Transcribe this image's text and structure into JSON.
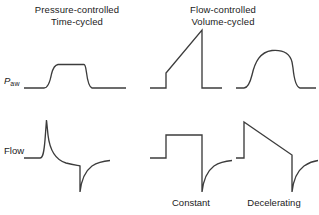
{
  "figure": {
    "background_color": "#ffffff",
    "stroke_color": "#3c3c3c",
    "text_color": "#1a1a1a",
    "width": 319,
    "height": 215
  },
  "columns": [
    {
      "id": "pressure-controlled",
      "title_line1": "Pressure-controlled",
      "title_line2": "Time-cycled"
    },
    {
      "id": "flow-controlled",
      "title_line1": "Flow-controlled",
      "title_line2": "Volume-cycled"
    }
  ],
  "row_labels": {
    "pressure_main": "P",
    "pressure_subscript": "aw",
    "flow": "Flow"
  },
  "sub_captions": [
    {
      "id": "constant",
      "label": "Constant"
    },
    {
      "id": "decelerating",
      "label": "Decelerating"
    }
  ],
  "chart_data": {
    "type": "line",
    "xlabel": "",
    "ylabel": "",
    "grid": false,
    "legend": "none",
    "axis_ticks": "none",
    "panels": [
      {
        "id": "paw-pressure-controlled",
        "row": "Paw",
        "column": "Pressure-controlled Time-cycled",
        "description": "Baseline, rapid rounded rise to a square plateau, sustained plateau, rapid fall back to baseline",
        "baseline_y": 88,
        "peak_y": 64,
        "path": "M 24 88 L 44 88 C 48 88 50 82 51.5 74 C 53 68 54.5 65 58 64.5 L 84 64.5 L 84 64.5 C 85 64.5 85.6 66 86.4 72 C 87.4 80 88.6 87 92 88 L 126 88"
      },
      {
        "id": "paw-constant-flow",
        "row": "Paw",
        "column": "Flow-controlled Volume-cycled / Constant",
        "description": "Baseline, instantaneous step up (resistive), linear ramp rise to peak, instantaneous fall to baseline",
        "baseline_y": 88,
        "step_y": 73,
        "peak_y": 30,
        "path": "M 150 88 L 166 88 L 166 73 L 202 30 L 202 88 L 222 88"
      },
      {
        "id": "paw-decelerating-flow",
        "row": "Paw",
        "column": "Flow-controlled Volume-cycled / Decelerating",
        "description": "Baseline, rounded rise to a domed peak, slight decline, then rapid fall to baseline",
        "baseline_y": 88,
        "peak_y": 50,
        "path": "M 236 88 L 244 88 C 248 88 250 83 252 75 C 255 62 260 52 272 50.5 C 284 49.5 290 54 292 62 L 293 68 C 294 78 296 87 300 88 L 316 88"
      },
      {
        "id": "flow-pressure-controlled",
        "row": "Flow",
        "column": "Pressure-controlled Time-cycled",
        "description": "Baseline, sharp inspiratory spike, exponential decay toward baseline, then abrupt negative expiratory deflection with exponential return to baseline",
        "baseline_y": 158,
        "peak_y": 120,
        "trough_y": 192,
        "path": "M 24 158 L 40 158 C 43 158 44 152 45 140 L 46.5 120 L 48 135 C 50 152 56 160 66 163 C 74 165 78 165.5 80 166 L 80 192 C 81 183 84 172 92 166 C 98 162 104 161 110 160.5"
      },
      {
        "id": "flow-constant",
        "row": "Flow",
        "column": "Flow-controlled Volume-cycled / Constant",
        "description": "Baseline, square step up to constant inspiratory flow, constant plateau, abrupt drop to negative expiratory peak with exponential return",
        "baseline_y": 158,
        "plateau_y": 135,
        "trough_y": 192,
        "path": "M 150 158 L 166 158 L 166 135 L 202 135 L 202 192 C 203 183 206 172 214 166 C 220 162 226 161 232 160.5"
      },
      {
        "id": "flow-decelerating",
        "row": "Flow",
        "column": "Flow-controlled Volume-cycled / Decelerating",
        "description": "Baseline, step up to peak inspiratory flow, linear decelerating ramp down, abrupt drop to negative expiratory peak with exponential return",
        "baseline_y": 158,
        "peak_y": 122,
        "ramp_end_y": 155,
        "trough_y": 192,
        "path": "M 236 158 L 244 158 L 244 122 L 292 155 L 292 192 C 293 183 296 172 304 166 C 310 162 314 161 318 160.5"
      }
    ]
  }
}
